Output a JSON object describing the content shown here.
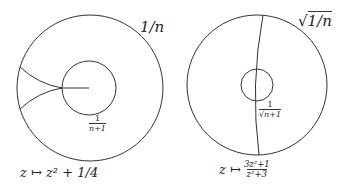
{
  "left_diagram": {
    "outer_label": "1/n",
    "inner_label": {
      "num": "1",
      "den": "n+1"
    },
    "map_label": "z ↦ z² + 1/4",
    "stroke_color": "#333333"
  },
  "right_diagram": {
    "outer_label": "√1/n",
    "outer_label_radical": "√",
    "outer_label_radicand": "1/n",
    "inner_label": {
      "num": "1",
      "den_radical": "√",
      "den": "n+1"
    },
    "map_prefix": "z ↦",
    "map_fraction": {
      "num": "3z²+1",
      "den": "z²+3"
    },
    "stroke_color": "#333333"
  }
}
